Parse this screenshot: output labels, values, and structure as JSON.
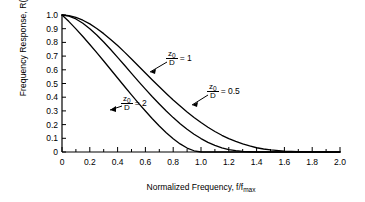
{
  "chart_data": {
    "type": "line",
    "title": "",
    "xlabel": "Normalized Frequency,  f/f",
    "xlabel_sub": "max",
    "ylabel": "Frequency Response,  R(ω)",
    "xlim": [
      0,
      2.0
    ],
    "ylim": [
      0,
      1.0
    ],
    "grid": false,
    "legend_position": "inline-annotations",
    "xticks": [
      "0",
      "0.2",
      "0.4",
      "0.6",
      "0.8",
      "1.0",
      "1.2",
      "1.4",
      "1.6",
      "1.8",
      "2.0"
    ],
    "xtick_values": [
      0,
      0.2,
      0.4,
      0.6,
      0.8,
      1.0,
      1.2,
      1.4,
      1.6,
      1.8,
      2.0
    ],
    "yticks": [
      "1.0",
      "0.9",
      "0.8",
      "0.7",
      "0.6",
      "0.5",
      "0.4",
      "0.3",
      "0.2",
      "0.1",
      "0"
    ],
    "ytick_values": [
      1.0,
      0.9,
      0.8,
      0.7,
      0.6,
      0.5,
      0.4,
      0.3,
      0.2,
      0.1,
      0
    ],
    "x": [
      0,
      0.05,
      0.1,
      0.15,
      0.2,
      0.25,
      0.3,
      0.35,
      0.4,
      0.45,
      0.5,
      0.55,
      0.6,
      0.65,
      0.7,
      0.75,
      0.8,
      0.85,
      0.9,
      0.95,
      1.0,
      1.05,
      1.1,
      1.15,
      1.2,
      1.25,
      1.3,
      1.35,
      1.4,
      1.45,
      1.5,
      1.6,
      1.7,
      1.8,
      1.9,
      2.0
    ],
    "series": [
      {
        "name": "z0/D = 0.5",
        "label_numerator": "z",
        "label_numerator_sub": "0",
        "label_denominator": "D",
        "label_equals": "= 0.5",
        "values": [
          1.0,
          0.995,
          0.982,
          0.962,
          0.935,
          0.902,
          0.864,
          0.822,
          0.777,
          0.729,
          0.679,
          0.628,
          0.577,
          0.526,
          0.476,
          0.427,
          0.38,
          0.335,
          0.292,
          0.252,
          0.215,
          0.181,
          0.15,
          0.122,
          0.098,
          0.077,
          0.059,
          0.044,
          0.031,
          0.022,
          0.015,
          0.007,
          0.003,
          0.001,
          0.0,
          0.0
        ]
      },
      {
        "name": "z0/D = 1",
        "label_numerator": "z",
        "label_numerator_sub": "0",
        "label_denominator": "D",
        "label_equals": "= 1",
        "values": [
          1.0,
          0.992,
          0.971,
          0.94,
          0.9,
          0.854,
          0.803,
          0.748,
          0.691,
          0.633,
          0.574,
          0.516,
          0.459,
          0.403,
          0.35,
          0.299,
          0.251,
          0.207,
          0.166,
          0.13,
          0.098,
          0.07,
          0.048,
          0.03,
          0.018,
          0.01,
          0.005,
          0.002,
          0.0,
          0.0,
          0.0,
          0.0,
          0.0,
          0.0,
          0.0,
          0.0
        ]
      },
      {
        "name": "z0/D = 2",
        "label_numerator": "z",
        "label_numerator_sub": "0",
        "label_denominator": "D",
        "label_equals": "= 2",
        "values": [
          1.0,
          0.952,
          0.899,
          0.843,
          0.785,
          0.725,
          0.664,
          0.602,
          0.54,
          0.478,
          0.417,
          0.357,
          0.299,
          0.243,
          0.19,
          0.141,
          0.097,
          0.059,
          0.029,
          0.009,
          0.0,
          0.0,
          0.0,
          0.0,
          0.0,
          0.0,
          0.0,
          0.0,
          0.0,
          0.0,
          0.0,
          0.0,
          0.0,
          0.0,
          0.0,
          0.0
        ]
      }
    ],
    "annotations": [
      {
        "text": "z0/D = 1",
        "target_x": 0.62,
        "target_y": 0.53
      },
      {
        "text": "z0/D = 0.5",
        "target_x": 0.94,
        "target_y": 0.22
      },
      {
        "text": "z0/D = 2",
        "target_x": 0.4,
        "target_y": 0.23
      }
    ],
    "colors": {
      "line": "#000000",
      "axis": "#000000",
      "background": "#ffffff"
    }
  }
}
